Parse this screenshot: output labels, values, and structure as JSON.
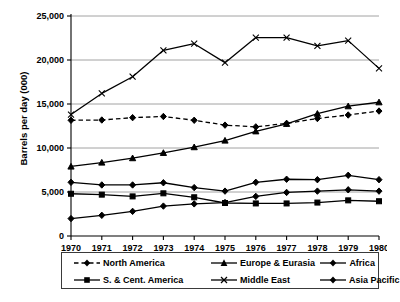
{
  "chart_data": {
    "type": "line",
    "title": "",
    "xlabel": "",
    "ylabel": "Barrels per day (000)",
    "x": [
      1970,
      1971,
      1972,
      1973,
      1974,
      1975,
      1976,
      1977,
      1978,
      1979,
      1980
    ],
    "xtick_labels": [
      "1970",
      "1971",
      "1972",
      "1973",
      "1974",
      "1975",
      "1976",
      "1977",
      "1978",
      "1979",
      "1980"
    ],
    "ytick_labels": [
      "0",
      "5,000",
      "10,000",
      "15,000",
      "20,000",
      "25,000"
    ],
    "ytick_values": [
      0,
      5000,
      10000,
      15000,
      20000,
      25000
    ],
    "ylim": [
      0,
      25000
    ],
    "xlim": [
      1970,
      1980
    ],
    "grid": "horizontal",
    "legend_position": "bottom",
    "series": [
      {
        "name": "North America",
        "marker": "diamond",
        "line_style": "dashed",
        "values": [
          13150,
          13180,
          13450,
          13580,
          13150,
          12600,
          12400,
          12800,
          13350,
          13750,
          14200
        ]
      },
      {
        "name": "S. & Cent. America",
        "marker": "square",
        "line_style": "solid",
        "values": [
          4800,
          4700,
          4500,
          4850,
          4400,
          3750,
          3700,
          3700,
          3800,
          4050,
          3950
        ]
      },
      {
        "name": "Europe & Eurasia",
        "marker": "triangle",
        "line_style": "solid",
        "values": [
          7900,
          8350,
          8850,
          9450,
          10100,
          10850,
          11900,
          12750,
          13900,
          14750,
          15200
        ]
      },
      {
        "name": "Middle East",
        "marker": "cross",
        "line_style": "solid",
        "values": [
          13800,
          16200,
          18100,
          21100,
          21850,
          19700,
          22550,
          22550,
          21600,
          22200,
          19050
        ]
      },
      {
        "name": "Africa",
        "marker": "diamond",
        "line_style": "solid",
        "values": [
          6100,
          5800,
          5800,
          6050,
          5500,
          5100,
          6100,
          6450,
          6400,
          6900,
          6400
        ]
      },
      {
        "name": "Asia Pacific",
        "marker": "diamond",
        "line_style": "solid",
        "values": [
          1980,
          2350,
          2800,
          3400,
          3650,
          3800,
          4500,
          4950,
          5100,
          5250,
          5100
        ]
      }
    ]
  },
  "legend": {
    "entries": [
      {
        "label": "North America",
        "marker": "diamond",
        "line_style": "dashed"
      },
      {
        "label": "Europe & Eurasia",
        "marker": "triangle",
        "line_style": "solid"
      },
      {
        "label": "Africa",
        "marker": "diamond",
        "line_style": "solid"
      },
      {
        "label": "S. & Cent. America",
        "marker": "square",
        "line_style": "solid"
      },
      {
        "label": "Middle East",
        "marker": "cross",
        "line_style": "solid"
      },
      {
        "label": "Asia Pacific",
        "marker": "diamond",
        "line_style": "solid"
      }
    ]
  },
  "colors": {
    "line": "#000000",
    "grid": "#8c8c8c",
    "axis": "#000000",
    "background": "#ffffff"
  }
}
